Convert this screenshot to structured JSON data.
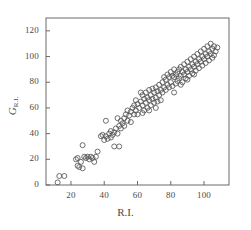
{
  "chart_data": {
    "type": "scatter",
    "title": "",
    "xlabel": "R.I.",
    "ylabel": "G_R.I.",
    "ylabel_base": "G",
    "ylabel_sub": "R.I.",
    "xlim": [
      5,
      115
    ],
    "ylim": [
      0,
      130
    ],
    "xticks": [
      20,
      40,
      60,
      80,
      100
    ],
    "yticks": [
      0,
      20,
      40,
      60,
      80,
      100,
      120
    ],
    "xtick_labels": [
      "20",
      "40",
      "60",
      "80",
      "100"
    ],
    "ytick_labels": [
      "0",
      "20",
      "40",
      "60",
      "80",
      "100",
      "120"
    ],
    "grid": false,
    "legend": null,
    "frame": "box",
    "marker": "open-circle",
    "marker_size": 5,
    "marker_color": "#555555",
    "n_points": 152,
    "correlation": "strong positive linear",
    "points": [
      [
        12,
        2
      ],
      [
        13,
        7
      ],
      [
        16,
        7
      ],
      [
        23,
        20
      ],
      [
        24,
        21
      ],
      [
        24,
        15
      ],
      [
        25,
        14
      ],
      [
        26,
        18
      ],
      [
        27,
        13
      ],
      [
        27,
        31
      ],
      [
        28,
        22
      ],
      [
        29,
        21
      ],
      [
        30,
        22
      ],
      [
        31,
        20
      ],
      [
        32,
        22
      ],
      [
        33,
        21
      ],
      [
        34,
        18
      ],
      [
        35,
        22
      ],
      [
        36,
        26
      ],
      [
        38,
        38
      ],
      [
        39,
        39
      ],
      [
        40,
        35
      ],
      [
        41,
        38
      ],
      [
        41,
        50
      ],
      [
        42,
        36
      ],
      [
        43,
        40
      ],
      [
        44,
        37
      ],
      [
        44,
        42
      ],
      [
        45,
        39
      ],
      [
        46,
        41
      ],
      [
        46,
        30
      ],
      [
        47,
        44
      ],
      [
        48,
        40
      ],
      [
        48,
        52
      ],
      [
        49,
        46
      ],
      [
        49,
        30
      ],
      [
        50,
        50
      ],
      [
        50,
        44
      ],
      [
        51,
        48
      ],
      [
        52,
        52
      ],
      [
        52,
        46
      ],
      [
        53,
        55
      ],
      [
        54,
        50
      ],
      [
        54,
        58
      ],
      [
        55,
        54
      ],
      [
        56,
        57
      ],
      [
        56,
        49
      ],
      [
        57,
        60
      ],
      [
        58,
        55
      ],
      [
        58,
        62
      ],
      [
        59,
        58
      ],
      [
        60,
        63
      ],
      [
        60,
        55
      ],
      [
        61,
        60
      ],
      [
        62,
        65
      ],
      [
        62,
        72
      ],
      [
        63,
        62
      ],
      [
        63,
        70
      ],
      [
        64,
        67
      ],
      [
        64,
        58
      ],
      [
        65,
        72
      ],
      [
        65,
        64
      ],
      [
        66,
        68
      ],
      [
        66,
        60
      ],
      [
        67,
        74
      ],
      [
        67,
        66
      ],
      [
        68,
        70
      ],
      [
        68,
        62
      ],
      [
        69,
        75
      ],
      [
        69,
        67
      ],
      [
        70,
        72
      ],
      [
        70,
        64
      ],
      [
        71,
        76
      ],
      [
        71,
        68
      ],
      [
        72,
        73
      ],
      [
        72,
        65
      ],
      [
        73,
        78
      ],
      [
        73,
        70
      ],
      [
        74,
        74
      ],
      [
        74,
        66
      ],
      [
        75,
        80
      ],
      [
        75,
        72
      ],
      [
        76,
        84
      ],
      [
        76,
        76
      ],
      [
        77,
        82
      ],
      [
        77,
        74
      ],
      [
        78,
        86
      ],
      [
        78,
        78
      ],
      [
        79,
        84
      ],
      [
        79,
        76
      ],
      [
        80,
        88
      ],
      [
        80,
        80
      ],
      [
        81,
        85
      ],
      [
        81,
        77
      ],
      [
        82,
        84
      ],
      [
        82,
        90
      ],
      [
        83,
        86
      ],
      [
        83,
        79
      ],
      [
        84,
        88
      ],
      [
        84,
        81
      ],
      [
        85,
        90
      ],
      [
        85,
        83
      ],
      [
        86,
        92
      ],
      [
        86,
        85
      ],
      [
        87,
        88
      ],
      [
        87,
        80
      ],
      [
        88,
        94
      ],
      [
        88,
        86
      ],
      [
        89,
        90
      ],
      [
        89,
        83
      ],
      [
        90,
        96
      ],
      [
        90,
        88
      ],
      [
        91,
        92
      ],
      [
        91,
        85
      ],
      [
        92,
        98
      ],
      [
        92,
        90
      ],
      [
        93,
        94
      ],
      [
        93,
        87
      ],
      [
        94,
        100
      ],
      [
        94,
        92
      ],
      [
        95,
        96
      ],
      [
        95,
        89
      ],
      [
        96,
        102
      ],
      [
        96,
        94
      ],
      [
        97,
        98
      ],
      [
        97,
        91
      ],
      [
        98,
        104
      ],
      [
        98,
        96
      ],
      [
        99,
        100
      ],
      [
        99,
        93
      ],
      [
        100,
        106
      ],
      [
        100,
        98
      ],
      [
        101,
        102
      ],
      [
        101,
        95
      ],
      [
        102,
        108
      ],
      [
        102,
        100
      ],
      [
        103,
        104
      ],
      [
        103,
        97
      ],
      [
        104,
        110
      ],
      [
        104,
        102
      ],
      [
        105,
        106
      ],
      [
        105,
        99
      ],
      [
        106,
        108
      ],
      [
        106,
        101
      ],
      [
        107,
        104
      ],
      [
        108,
        107
      ],
      [
        59,
        66
      ],
      [
        63,
        56
      ],
      [
        67,
        58
      ],
      [
        71,
        60
      ],
      [
        82,
        72
      ],
      [
        86,
        78
      ],
      [
        90,
        82
      ],
      [
        94,
        86
      ]
    ]
  }
}
